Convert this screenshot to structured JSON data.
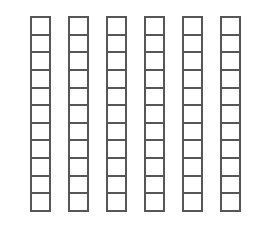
{
  "diagram": {
    "type": "unit-bar-grid",
    "background_color": "#ffffff",
    "stroke_color": "#565656",
    "cell_fill_color": "#ffffff",
    "stroke_width_px": 2,
    "rod_count": 6,
    "cells_per_rod": 11,
    "total_cells": 66,
    "geometry": {
      "group_left_px": 30,
      "group_top_px": 16,
      "group_width_px": 211,
      "group_height_px": 196,
      "rod_width_px": 21,
      "rod_gap_px": 17,
      "cell_height_px": 17.8
    },
    "rods": [
      {
        "index": 1,
        "label": "rod-1",
        "cells": 11
      },
      {
        "index": 2,
        "label": "rod-2",
        "cells": 11
      },
      {
        "index": 3,
        "label": "rod-3",
        "cells": 11
      },
      {
        "index": 4,
        "label": "rod-4",
        "cells": 11
      },
      {
        "index": 5,
        "label": "rod-5",
        "cells": 11
      },
      {
        "index": 6,
        "label": "rod-6",
        "cells": 11
      }
    ]
  }
}
